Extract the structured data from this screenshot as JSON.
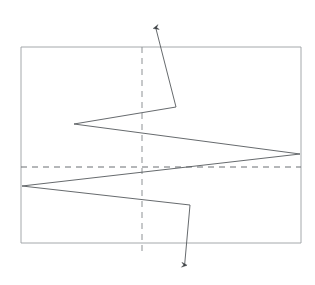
{
  "canvas": {
    "width": 315,
    "height": 285,
    "background": "#ffffff"
  },
  "diagram": {
    "type": "line-drawing",
    "stroke_color": "#55595c",
    "dashed_color": "#6b6f72",
    "frame_color": "#9a9ea1",
    "stroke_width": 0.9,
    "dash_pattern": "6 5"
  },
  "frame": {
    "name": "bounding-rectangle",
    "x": 21,
    "y": 47,
    "width": 280,
    "height": 196,
    "left": 21,
    "top": 47,
    "right": 301,
    "bottom": 243
  },
  "axes": {
    "vertical_dashed": {
      "name": "vertical-centre-axis",
      "x": 142,
      "y1": 47,
      "y2": 252
    },
    "horizontal_dashed": {
      "name": "horizontal-centre-axis",
      "y": 167,
      "x1": 21,
      "x2": 301
    }
  },
  "waveform": {
    "name": "sawtooth-polyline",
    "points": "176,107 74,124 300,154 22,186 190,205",
    "vertices": [
      {
        "label": "v1",
        "x": 176,
        "y": 107
      },
      {
        "label": "v2",
        "x": 74,
        "y": 124
      },
      {
        "label": "v3",
        "x": 300,
        "y": 154
      },
      {
        "label": "v4",
        "x": 22,
        "y": 186
      },
      {
        "label": "v5",
        "x": 190,
        "y": 205
      }
    ]
  },
  "arrows": {
    "up": {
      "name": "up-arrow",
      "from_x": 176,
      "from_y": 107,
      "to_x": 154,
      "to_y": 21,
      "direction": "up"
    },
    "down": {
      "name": "down-arrow",
      "from_x": 190,
      "from_y": 205,
      "to_x": 184,
      "to_y": 272,
      "direction": "down"
    }
  }
}
